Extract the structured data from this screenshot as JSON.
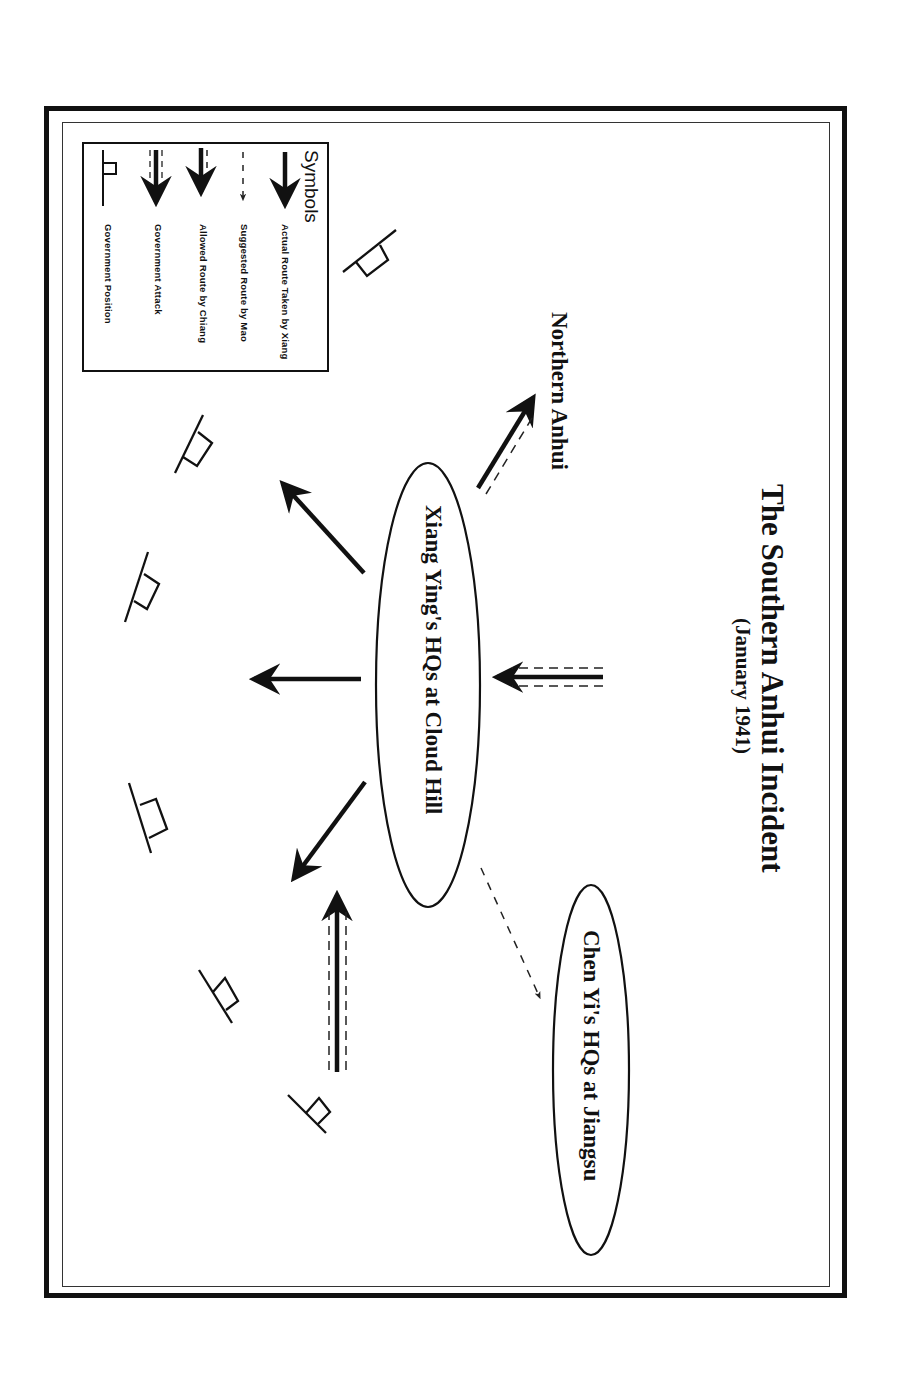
{
  "diagram": {
    "title": "The Southern Anhui Incident",
    "subtitle": "(January 1941)",
    "orientation": "rotated 90 degrees clockwise",
    "nodes": [
      {
        "id": "xiang_hq",
        "label": "Xiang Ying's HQs at Cloud Hill",
        "shape": "ellipse"
      },
      {
        "id": "chen_hq",
        "label": "Chen Yi's HQs at Jiangsu",
        "shape": "ellipse"
      },
      {
        "id": "northern_anhui",
        "label": "Northern Anhui",
        "shape": "text"
      }
    ],
    "edges": [
      {
        "from": "xiang_hq",
        "to": "northern_anhui",
        "type": "allowed_route_by_chiang"
      },
      {
        "from": "xiang_hq",
        "to": "chen_hq",
        "type": "suggested_route_by_mao"
      },
      {
        "from": "north",
        "to": "xiang_hq",
        "type": "government_attack"
      },
      {
        "from": "xiang_hq",
        "to": "south-upper",
        "type": "actual_route_taken_by_xiang"
      },
      {
        "from": "xiang_hq",
        "to": "south",
        "type": "actual_route_taken_by_xiang"
      },
      {
        "from": "xiang_hq",
        "to": "south-lower",
        "type": "actual_route_taken_by_xiang"
      },
      {
        "from": "south-east",
        "to": "xiang_hq-direction",
        "type": "government_attack"
      }
    ],
    "government_positions_count": 6
  },
  "legend": {
    "heading": "Symbols",
    "items": [
      {
        "symbol": "solid-arrow",
        "label": "Actual Route Taken by Xiang"
      },
      {
        "symbol": "dashed-arrow",
        "label": "Suggested Route by Mao"
      },
      {
        "symbol": "solid-arrow-with-dash",
        "label": "Allowed Route by Chiang"
      },
      {
        "symbol": "double-dashed-arrow",
        "label": "Government Attack"
      },
      {
        "symbol": "flag",
        "label": "Government Position"
      }
    ]
  },
  "colors": {
    "ink": "#111111",
    "paper": "#ffffff"
  }
}
